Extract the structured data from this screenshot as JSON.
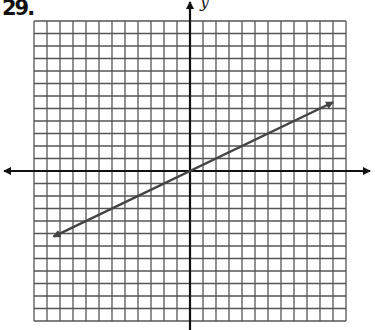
{
  "problem_label": "29.",
  "chart_data": {
    "type": "line",
    "title": "",
    "xlabel": "",
    "ylabel": "y",
    "xlim": [
      -12,
      12
    ],
    "ylim": [
      -12,
      12
    ],
    "grid": true,
    "grid_step": 1,
    "series": [
      {
        "name": "line",
        "equation": "y = x/2",
        "x": [
          -10.5,
          11
        ],
        "y": [
          -5.25,
          5.5
        ],
        "arrows": "both"
      }
    ]
  },
  "colors": {
    "grid": "#555555",
    "axes": "#111111",
    "line": "#444444"
  }
}
